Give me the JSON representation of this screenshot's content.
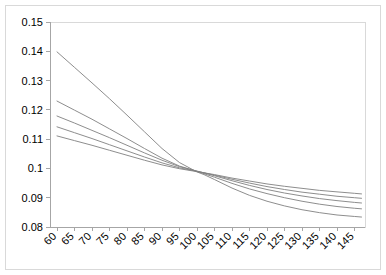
{
  "chart_data": {
    "type": "line",
    "title": "",
    "subtitle": "",
    "xlabel": "",
    "ylabel": "",
    "xlim": [
      58,
      148
    ],
    "ylim": [
      0.08,
      0.15
    ],
    "grid": false,
    "legend": "none",
    "x_tick_labels": [
      "60",
      "65",
      "70",
      "75",
      "80",
      "85",
      "90",
      "95",
      "100",
      "105",
      "110",
      "115",
      "120",
      "125",
      "130",
      "135",
      "140",
      "145"
    ],
    "x_ticks": [
      60,
      65,
      70,
      75,
      80,
      85,
      90,
      95,
      100,
      105,
      110,
      115,
      120,
      125,
      130,
      135,
      140,
      145
    ],
    "y_tick_labels": [
      "0.08",
      "0.09",
      "0.1",
      "0.11",
      "0.12",
      "0.13",
      "0.14",
      "0.15"
    ],
    "y_ticks": [
      0.08,
      0.09,
      0.1,
      0.11,
      0.12,
      0.13,
      0.14,
      0.15
    ],
    "x": [
      60,
      65,
      70,
      75,
      80,
      85,
      90,
      95,
      100,
      102,
      105,
      110,
      115,
      120,
      125,
      130,
      135,
      140,
      145,
      147
    ],
    "series": [
      {
        "name": "curve-1",
        "color": "#808080",
        "values": [
          0.1398,
          0.1345,
          0.1292,
          0.1238,
          0.1182,
          0.1125,
          0.1068,
          0.102,
          0.0988,
          0.0979,
          0.0962,
          0.0933,
          0.0908,
          0.0888,
          0.0872,
          0.0859,
          0.0849,
          0.0841,
          0.0836,
          0.0834
        ]
      },
      {
        "name": "curve-2",
        "color": "#808080",
        "values": [
          0.123,
          0.1199,
          0.1168,
          0.1135,
          0.1102,
          0.1068,
          0.1035,
          0.1008,
          0.099,
          0.0982,
          0.097,
          0.0949,
          0.093,
          0.0914,
          0.09,
          0.0888,
          0.0878,
          0.087,
          0.0864,
          0.0862
        ]
      },
      {
        "name": "curve-3",
        "color": "#808080",
        "values": [
          0.1179,
          0.1155,
          0.113,
          0.1105,
          0.1079,
          0.1053,
          0.1028,
          0.1006,
          0.0991,
          0.0985,
          0.0975,
          0.0958,
          0.0942,
          0.0928,
          0.0916,
          0.0906,
          0.0897,
          0.089,
          0.0884,
          0.0882
        ]
      },
      {
        "name": "curve-4",
        "color": "#808080",
        "values": [
          0.1142,
          0.1122,
          0.1102,
          0.1081,
          0.106,
          0.1039,
          0.1019,
          0.1002,
          0.099,
          0.0985,
          0.0977,
          0.0963,
          0.095,
          0.0938,
          0.0928,
          0.0919,
          0.0912,
          0.0905,
          0.09,
          0.0898
        ]
      },
      {
        "name": "curve-5",
        "color": "#808080",
        "values": [
          0.1111,
          0.1095,
          0.1079,
          0.1062,
          0.1045,
          0.1028,
          0.1012,
          0.0999,
          0.0989,
          0.0985,
          0.0979,
          0.0967,
          0.0957,
          0.0947,
          0.0939,
          0.0932,
          0.0925,
          0.092,
          0.0915,
          0.0913
        ]
      }
    ]
  },
  "plot": {
    "background_color": "#ffffff",
    "border_color": "#d9d9d9",
    "axis_color": "#a6a6a6",
    "line_color": "#808080",
    "x_label_rotation": -45
  }
}
